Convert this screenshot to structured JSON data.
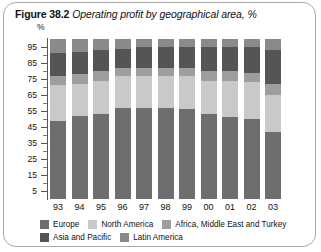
{
  "figure": {
    "label": "Figure 38.2",
    "caption": "Operating profit by geographical area, %"
  },
  "chart_data": {
    "type": "bar",
    "subtype": "stacked-percentage-column",
    "title": "Operating profit by geographical area, %",
    "xlabel": "",
    "ylabel": "%",
    "ylim": [
      0,
      100
    ],
    "grid": false,
    "legend_position": "bottom",
    "y_unit_label": "%",
    "y_ticks_major": [
      95,
      85,
      75,
      65,
      55,
      45,
      35,
      25,
      15,
      5
    ],
    "y_ticks_minor": [
      90,
      80,
      70,
      60,
      50,
      40,
      30,
      20,
      10
    ],
    "categories": [
      "93",
      "94",
      "95",
      "96",
      "97",
      "98",
      "99",
      "00",
      "01",
      "02",
      "03"
    ],
    "series": [
      {
        "name": "Europe",
        "color": "#6e6e6e",
        "values": [
          49,
          52,
          53,
          57,
          57,
          57,
          56,
          53,
          51,
          50,
          42
        ]
      },
      {
        "name": "North America",
        "color": "#c9c9c9",
        "values": [
          22,
          20,
          21,
          20,
          20,
          20,
          21,
          21,
          23,
          23,
          23
        ]
      },
      {
        "name": "Africa, Middle East and Turkey",
        "color": "#9e9e9e",
        "values": [
          6,
          6,
          6,
          5,
          5,
          5,
          5,
          6,
          6,
          6,
          7
        ]
      },
      {
        "name": "Asia and Pacific",
        "color": "#555555",
        "values": [
          14,
          14,
          13,
          12,
          13,
          13,
          13,
          15,
          15,
          16,
          21
        ]
      },
      {
        "name": "Latin America",
        "color": "#8a8a8a",
        "values": [
          9,
          8,
          7,
          6,
          5,
          5,
          5,
          5,
          5,
          5,
          7
        ]
      }
    ]
  },
  "legend": {
    "row1": [
      {
        "label": "Europe",
        "color": "#6e6e6e"
      },
      {
        "label": "North America",
        "color": "#c9c9c9"
      },
      {
        "label": "Africa, Middle East and Turkey",
        "color": "#9e9e9e"
      }
    ],
    "row2": [
      {
        "label": "Asia and Pacific",
        "color": "#555555"
      },
      {
        "label": "Latin America",
        "color": "#8a8a8a"
      }
    ]
  }
}
